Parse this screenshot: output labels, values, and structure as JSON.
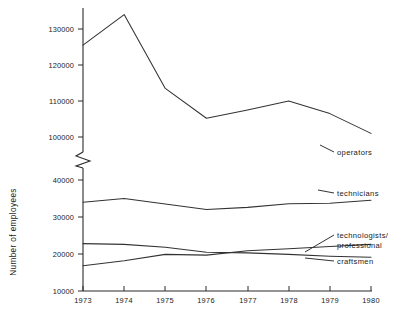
{
  "chart_data": {
    "type": "line",
    "title": "",
    "xlabel": "",
    "ylabel": "Number of employees",
    "x": [
      1973,
      1974,
      1975,
      1976,
      1977,
      1978,
      1979,
      1980
    ],
    "categories": [
      "1973",
      "1974",
      "1975",
      "1976",
      "1977",
      "1978",
      "1979",
      "1980"
    ],
    "grid": false,
    "legend_position": "right-inline-labels",
    "axis_break": {
      "present": true,
      "between": [
        45000,
        95000
      ],
      "note": "zigzag break on y-axis between upper and lower scales"
    },
    "upper_axis": {
      "ticks": [
        100000,
        110000,
        120000,
        130000
      ],
      "tick_labels": [
        "100000",
        "110000",
        "120000",
        "130000"
      ],
      "ylim": [
        95000,
        136000
      ]
    },
    "lower_axis": {
      "ticks": [
        10000,
        20000,
        30000,
        40000
      ],
      "tick_labels": [
        "10000",
        "20000",
        "30000",
        "40000"
      ],
      "ylim": [
        10000,
        45000
      ]
    },
    "series": [
      {
        "name": "operators",
        "label": "operators",
        "scale": "upper",
        "values": [
          125500,
          134000,
          113500,
          105200,
          107500,
          110000,
          106500,
          101000
        ]
      },
      {
        "name": "technicians",
        "label": "technicians",
        "scale": "lower",
        "values": [
          34000,
          35000,
          33500,
          32000,
          32600,
          33600,
          33700,
          34500
        ]
      },
      {
        "name": "technologists/professional",
        "label": "technologists/\nprofessional",
        "label_line1": "technologists/",
        "label_line2": "professional",
        "scale": "lower",
        "values": [
          16800,
          18200,
          19900,
          19700,
          20900,
          21400,
          22000,
          22600
        ]
      },
      {
        "name": "craftsmen",
        "label": "craftsmen",
        "scale": "lower",
        "values": [
          22800,
          22600,
          21800,
          20500,
          20300,
          19900,
          19400,
          19100
        ]
      }
    ]
  },
  "axis": {
    "y_title": "Number of employees",
    "y_ticks_upper": [
      "130000",
      "120000",
      "110000",
      "100000"
    ],
    "y_ticks_lower": [
      "40000",
      "30000",
      "20000",
      "10000"
    ],
    "x_ticks": [
      "1973",
      "1974",
      "1975",
      "1976",
      "1977",
      "1978",
      "1979",
      "1980"
    ]
  },
  "labels": {
    "operators": "operators",
    "technicians": "technicians",
    "technologists_line1": "technologists/",
    "technologists_line2": "professional",
    "craftsmen": "craftsmen"
  },
  "colors": {
    "line": "#333333",
    "axis": "#2b2b2b",
    "text": "#1a1a1a",
    "background": "#ffffff"
  }
}
